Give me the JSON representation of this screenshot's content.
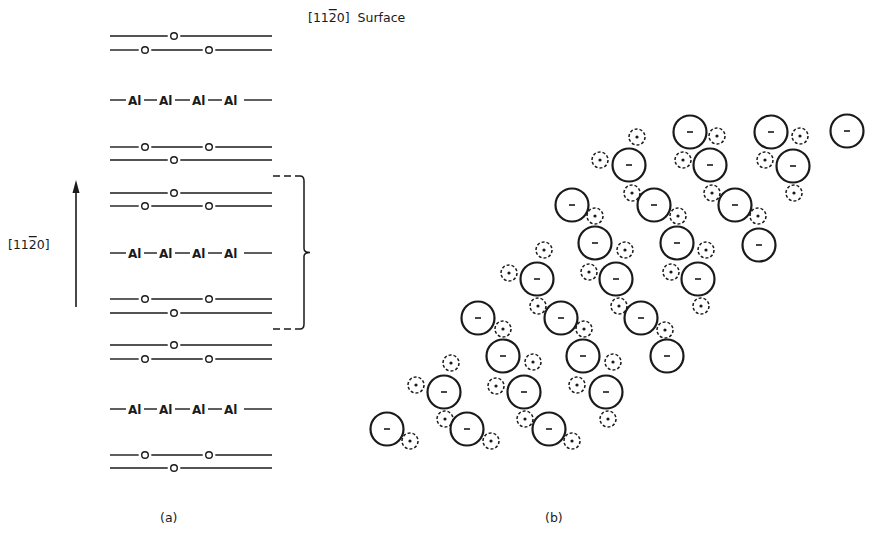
{
  "figure": {
    "surface_label": "[11Ā0] Surface",
    "surface_label_parts": {
      "prefix": "[11",
      "bar_digit": "2",
      "suffix": "0]",
      "word": "Surface"
    },
    "direction_label_parts": {
      "prefix": "[11",
      "bar_digit": "2",
      "suffix": "0]"
    },
    "panel_a_caption": "(a)",
    "panel_b_caption": "(b)",
    "ink_color": "#1a1a1a",
    "background": "#ffffff"
  },
  "panel_a": {
    "line_x_start": 110,
    "line_x_end": 272,
    "oxygen_symbol": "o",
    "al_symbol": "Al",
    "al_label_x": [
      128,
      159,
      192,
      224
    ],
    "layers": [
      {
        "type": "O",
        "y": 36,
        "sites_x": [
          174
        ]
      },
      {
        "type": "O",
        "y": 50,
        "sites_x": [
          145,
          209
        ]
      },
      {
        "type": "Al",
        "y": 100
      },
      {
        "type": "O",
        "y": 147,
        "sites_x": [
          145,
          209
        ]
      },
      {
        "type": "O",
        "y": 160,
        "sites_x": [
          174
        ]
      },
      {
        "type": "O",
        "y": 193,
        "sites_x": [
          174
        ]
      },
      {
        "type": "O",
        "y": 206,
        "sites_x": [
          145,
          209
        ]
      },
      {
        "type": "Al",
        "y": 253
      },
      {
        "type": "O",
        "y": 299,
        "sites_x": [
          145,
          209
        ]
      },
      {
        "type": "O",
        "y": 313,
        "sites_x": [
          174
        ]
      },
      {
        "type": "O",
        "y": 345,
        "sites_x": [
          174
        ]
      },
      {
        "type": "O",
        "y": 359,
        "sites_x": [
          145,
          209
        ]
      },
      {
        "type": "Al",
        "y": 409
      },
      {
        "type": "O",
        "y": 455,
        "sites_x": [
          145,
          209
        ]
      },
      {
        "type": "O",
        "y": 468,
        "sites_x": [
          174
        ]
      }
    ],
    "arrow": {
      "x": 76,
      "y_top": 180,
      "y_bottom": 307
    },
    "unit_cell_brace": {
      "y_top": 176,
      "y_bottom": 329,
      "x": 304,
      "tip_x": 310
    }
  },
  "panel_b": {
    "anion_sign": "–",
    "cation_sign": "+",
    "anion_radius": 16.5,
    "cation_radius": 8,
    "anions": [
      [
        690,
        132
      ],
      [
        771,
        132
      ],
      [
        847,
        131
      ],
      [
        629,
        165
      ],
      [
        710,
        165
      ],
      [
        793,
        166
      ],
      [
        572,
        205
      ],
      [
        654,
        205
      ],
      [
        735,
        205
      ],
      [
        595,
        243
      ],
      [
        677,
        243
      ],
      [
        759,
        245
      ],
      [
        537,
        279
      ],
      [
        616,
        279
      ],
      [
        698,
        279
      ],
      [
        478,
        318
      ],
      [
        561,
        318
      ],
      [
        641,
        318
      ],
      [
        503,
        356
      ],
      [
        583,
        356
      ],
      [
        667,
        356
      ],
      [
        444,
        392
      ],
      [
        524,
        392
      ],
      [
        606,
        392
      ],
      [
        387,
        429
      ],
      [
        467,
        429
      ],
      [
        549,
        429
      ]
    ],
    "cations": [
      [
        637,
        137
      ],
      [
        717,
        136
      ],
      [
        800,
        136
      ],
      [
        600,
        160
      ],
      [
        683,
        160
      ],
      [
        765,
        160
      ],
      [
        632,
        193
      ],
      [
        712,
        193
      ],
      [
        794,
        193
      ],
      [
        595,
        216
      ],
      [
        678,
        216
      ],
      [
        758,
        216
      ],
      [
        544,
        250
      ],
      [
        625,
        250
      ],
      [
        706,
        250
      ],
      [
        509,
        273
      ],
      [
        589,
        272
      ],
      [
        671,
        272
      ],
      [
        538,
        306
      ],
      [
        619,
        306
      ],
      [
        701,
        306
      ],
      [
        503,
        329
      ],
      [
        584,
        329
      ],
      [
        665,
        330
      ],
      [
        451,
        363
      ],
      [
        533,
        362
      ],
      [
        613,
        362
      ],
      [
        416,
        385
      ],
      [
        496,
        386
      ],
      [
        577,
        385
      ],
      [
        445,
        419
      ],
      [
        525,
        419
      ],
      [
        608,
        419
      ],
      [
        410,
        441
      ],
      [
        491,
        441
      ],
      [
        572,
        441
      ]
    ]
  }
}
